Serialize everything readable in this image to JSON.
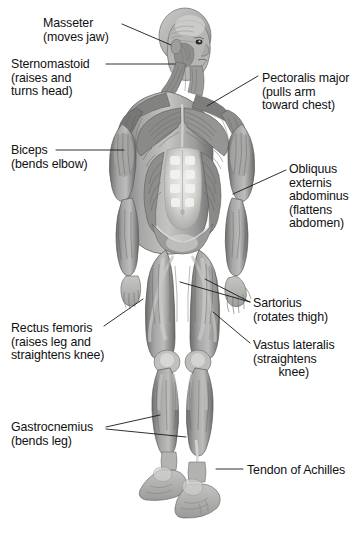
{
  "figure": {
    "view": "anterior (front) full body, head turned to its left",
    "palette": {
      "background": "#ffffff",
      "line": "#16181a",
      "text": "#111111",
      "muscle_dark": "#6b6b6b",
      "muscle_mid": "#9a9a9a",
      "muscle_light": "#c9c9c9",
      "highlight": "#e8e8e6",
      "shadow": "#4a4a4a"
    }
  },
  "labels": [
    {
      "id": "masseter",
      "side": "left",
      "lines": [
        "Masseter",
        "(moves jaw)"
      ],
      "x": 43,
      "y": 17,
      "leader": "M 122 24 L 171 45"
    },
    {
      "id": "sternomastoid",
      "side": "left",
      "lines": [
        "Sternomastoid",
        "(raises and",
        "turns head)"
      ],
      "x": 11,
      "y": 58,
      "leader": "M 106 64 L 175 64"
    },
    {
      "id": "biceps",
      "side": "left",
      "lines": [
        "Biceps",
        "(bends elbow)"
      ],
      "x": 11,
      "y": 144,
      "leader": "M 56 150 L 124 150"
    },
    {
      "id": "pectoralis-major",
      "side": "right",
      "lines": [
        "Pectoralis major",
        "(pulls arm",
        "toward chest)"
      ],
      "x": 262,
      "y": 72,
      "leader": "M 258 76 L 207 106"
    },
    {
      "id": "obliquus-externis-abdominus",
      "side": "right",
      "lines": [
        "Obliquus",
        "externis",
        "abdominus",
        "(flattens",
        "abdomen)"
      ],
      "x": 289,
      "y": 163,
      "leader": "M 286 170 L 233 194"
    },
    {
      "id": "rectus-femoris",
      "side": "left",
      "lines": [
        "Rectus femoris",
        "(raises leg and",
        "straightens knee)"
      ],
      "x": 11,
      "y": 322,
      "leader": "M 104 326 L 143 299"
    },
    {
      "id": "gastrocnemius",
      "side": "left",
      "lines": [
        "Gastrocnemius",
        "(bends leg)"
      ],
      "x": 11,
      "y": 421,
      "leader": "M 106 427 L 160 415 M 106 429 L 186 437"
    },
    {
      "id": "sartorius",
      "side": "right",
      "lines": [
        "Sartorius",
        "(rotates thigh)"
      ],
      "x": 253,
      "y": 297,
      "leader": "M 250 302 L 205 279 M 250 302 L 180 282"
    },
    {
      "id": "vastus-lateralis",
      "side": "right",
      "lines": [
        "Vastus lateralis",
        "(straightens",
        "knee)"
      ],
      "x": 253,
      "y": 339,
      "leader": "M 250 343 L 213 312"
    },
    {
      "id": "tendon-of-achilles",
      "side": "right",
      "lines": [
        "Tendon of Achilles"
      ],
      "x": 247,
      "y": 464,
      "leader": "M 243 469 L 216 469"
    }
  ]
}
